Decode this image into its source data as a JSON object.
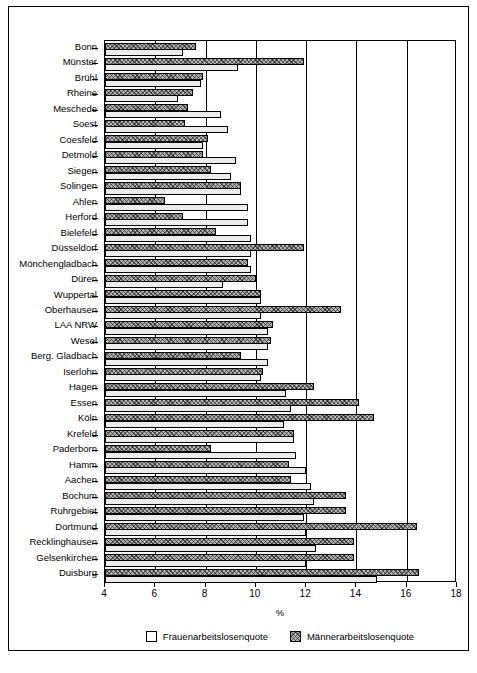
{
  "chart_data": {
    "type": "bar",
    "orientation": "horizontal",
    "title": "",
    "xlabel": "%",
    "ylabel": "",
    "xlim": [
      4,
      18
    ],
    "xticks": [
      4,
      6,
      8,
      10,
      12,
      14,
      16,
      18
    ],
    "grid": "vertical",
    "legend_position": "bottom",
    "categories": [
      "Bonn",
      "Münster",
      "Brühl",
      "Rheine",
      "Meschede",
      "Soest",
      "Coesfeld",
      "Detmold",
      "Siegen",
      "Solingen",
      "Ahlen",
      "Herford",
      "Bielefeld",
      "Düsseldorf",
      "Mönchengladbach",
      "Düren",
      "Wuppertal",
      "Oberhausen",
      "LAA NRW",
      "Wesel",
      "Berg. Gladbach",
      "Iserlohn",
      "Hagen",
      "Essen",
      "Köln",
      "Krefeld",
      "Paderborn",
      "Hamm",
      "Aachen",
      "Bochum",
      "Ruhrgebiet",
      "Dortmund",
      "Recklinghausen",
      "Gelsenkirchen",
      "Duisburg"
    ],
    "series": [
      {
        "name": "Frauenarbeitslosenquote",
        "key": "women",
        "color": "#ececec",
        "pattern": "solid-light",
        "values": [
          7.1,
          9.3,
          7.8,
          6.9,
          8.6,
          8.9,
          7.9,
          9.2,
          9.0,
          9.4,
          9.7,
          9.7,
          9.8,
          9.8,
          9.8,
          8.7,
          10.2,
          10.2,
          10.5,
          10.5,
          10.5,
          10.2,
          11.2,
          11.4,
          11.1,
          11.5,
          11.6,
          12.0,
          12.2,
          12.3,
          11.9,
          12.0,
          12.4,
          12.0,
          14.8
        ]
      },
      {
        "name": "Männerarbeitslosenquote",
        "key": "men",
        "color": "#b3b3b3",
        "pattern": "crosshatch",
        "values": [
          7.6,
          11.9,
          7.9,
          7.5,
          7.3,
          7.2,
          8.1,
          7.9,
          8.2,
          9.4,
          6.4,
          7.1,
          8.4,
          11.9,
          9.7,
          10.0,
          10.2,
          13.4,
          10.7,
          10.6,
          9.4,
          10.3,
          12.3,
          14.1,
          14.7,
          11.5,
          8.2,
          11.3,
          11.4,
          13.6,
          13.6,
          16.4,
          13.9,
          13.9,
          16.5
        ]
      }
    ]
  },
  "axis": {
    "x_title": "%",
    "tick_labels": [
      "4",
      "6",
      "8",
      "10",
      "12",
      "14",
      "16",
      "18"
    ]
  },
  "legend": {
    "items": [
      {
        "label": "Frauenarbeitslosenquote",
        "swatch": "women"
      },
      {
        "label": "Männerarbeitslosenquote",
        "swatch": "men"
      }
    ]
  }
}
